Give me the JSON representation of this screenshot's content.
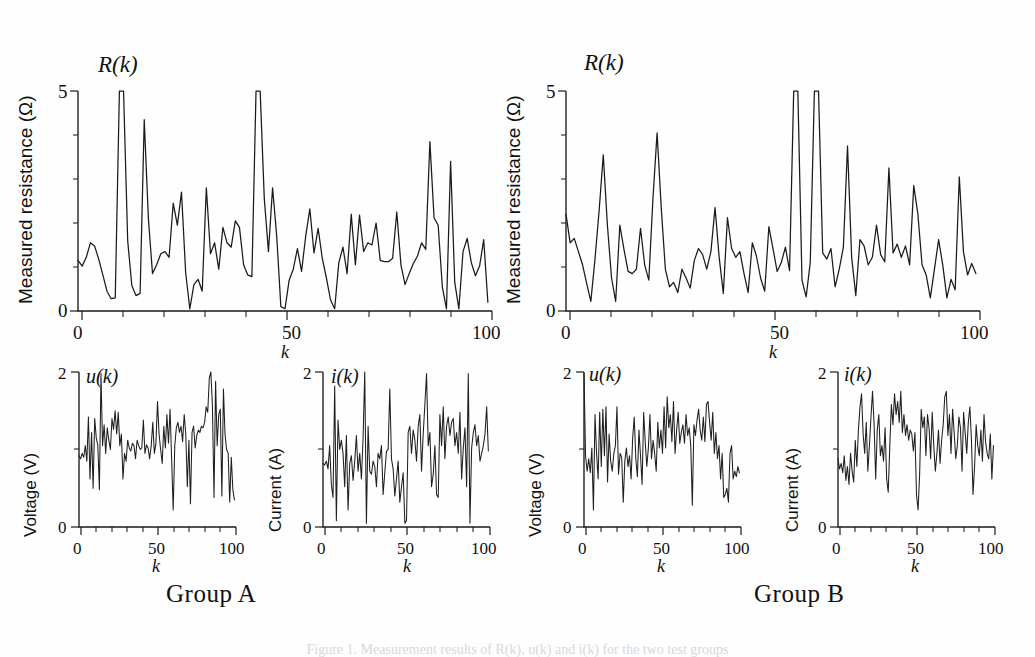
{
  "figure": {
    "caption": "Figure 1. Measurement results of R(k), u(k) and i(k) for the two test groups",
    "groups": [
      {
        "id": "A",
        "label": "Group A"
      },
      {
        "id": "B",
        "label": "Group B"
      }
    ]
  },
  "labels": {
    "resistance_axis_title": "Measured resistance (Ω)",
    "voltage_axis_title": "Voltage (V)",
    "current_axis_title": "Current (A)",
    "resistance_curve": "R(k)",
    "voltage_curve": "u(k)",
    "current_curve": "i(k)",
    "k_axis": "k",
    "tick_0": "0",
    "tick_50": "50",
    "tick_100": "100",
    "tick_2": "2",
    "tick_5": "5"
  },
  "chart_data": [
    {
      "id": "groupA-resistance",
      "type": "line",
      "title": "R(k)",
      "group": "Group A",
      "xlabel": "k",
      "ylabel": "Measured resistance (Ω)",
      "xlim": [
        0,
        100
      ],
      "ylim": [
        0,
        5
      ],
      "xticks": [
        0,
        50,
        100
      ],
      "yticks": [
        0,
        5
      ],
      "minor_xtick_step": 10,
      "minor_ytick_step": 1,
      "grid": false,
      "legend": "none",
      "clipped_above_ylim": true,
      "x": [
        0,
        1,
        2,
        3,
        4,
        5,
        6,
        7,
        8,
        9,
        10,
        11,
        12,
        13,
        14,
        15,
        16,
        17,
        18,
        19,
        20,
        21,
        22,
        23,
        24,
        25,
        26,
        27,
        28,
        29,
        30,
        31,
        32,
        33,
        34,
        35,
        36,
        37,
        38,
        39,
        40,
        41,
        42,
        43,
        44,
        45,
        46,
        47,
        48,
        49,
        50,
        51,
        52,
        53,
        54,
        55,
        56,
        57,
        58,
        59,
        60,
        61,
        62,
        63,
        64,
        65,
        66,
        67,
        68,
        69,
        70,
        71,
        72,
        73,
        74,
        75,
        76,
        77,
        78,
        79,
        80,
        81,
        82,
        83,
        84,
        85,
        86,
        87,
        88,
        89,
        90,
        91,
        92,
        93,
        94,
        95,
        96,
        97,
        98,
        99
      ],
      "values": [
        1.15,
        1.02,
        1.22,
        1.55,
        1.48,
        1.18,
        0.82,
        0.45,
        0.28,
        0.3,
        5.0,
        5.0,
        1.6,
        0.58,
        0.35,
        0.4,
        4.35,
        2.1,
        0.85,
        1.05,
        1.3,
        1.35,
        1.22,
        2.45,
        1.95,
        2.7,
        0.88,
        0.05,
        0.6,
        0.72,
        0.45,
        2.8,
        1.3,
        1.55,
        0.95,
        1.9,
        1.55,
        1.45,
        2.05,
        1.9,
        1.05,
        0.82,
        0.78,
        5.0,
        5.0,
        2.55,
        1.35,
        2.8,
        1.7,
        0.1,
        0.05,
        0.7,
        0.95,
        1.42,
        0.9,
        1.7,
        2.32,
        1.32,
        1.88,
        1.2,
        0.75,
        0.25,
        0.05,
        1.1,
        1.45,
        0.85,
        2.2,
        1.05,
        2.18,
        1.35,
        1.55,
        1.5,
        2.0,
        1.15,
        1.12,
        1.12,
        1.2,
        2.25,
        1.05,
        0.6,
        0.85,
        1.08,
        1.25,
        1.55,
        1.4,
        3.85,
        2.12,
        1.95,
        0.55,
        0.05,
        3.4,
        0.65,
        0.05,
        1.35,
        1.65,
        1.1,
        0.8,
        1.02,
        1.62,
        0.2
      ]
    },
    {
      "id": "groupA-voltage",
      "type": "line",
      "title": "u(k)",
      "group": "Group A",
      "xlabel": "k",
      "ylabel": "Voltage (V)",
      "xlim": [
        0,
        100
      ],
      "ylim": [
        0,
        2
      ],
      "xticks": [
        0,
        50,
        100
      ],
      "yticks": [
        0,
        2
      ],
      "minor_xtick_step": 10,
      "grid": false,
      "legend": "none",
      "x": [
        0,
        1,
        2,
        3,
        4,
        5,
        6,
        7,
        8,
        9,
        10,
        11,
        12,
        13,
        14,
        15,
        16,
        17,
        18,
        19,
        20,
        21,
        22,
        23,
        24,
        25,
        26,
        27,
        28,
        29,
        30,
        31,
        32,
        33,
        34,
        35,
        36,
        37,
        38,
        39,
        40,
        41,
        42,
        43,
        44,
        45,
        46,
        47,
        48,
        49,
        50,
        51,
        52,
        53,
        54,
        55,
        56,
        57,
        58,
        59,
        60,
        61,
        62,
        63,
        64,
        65,
        66,
        67,
        68,
        69,
        70,
        71,
        72,
        73,
        74,
        75,
        76,
        77,
        78,
        79,
        80,
        81,
        82,
        83,
        84,
        85,
        86,
        87,
        88,
        89,
        90,
        91,
        92,
        93,
        94,
        95,
        96,
        97,
        98,
        99
      ],
      "values": [
        0.92,
        0.88,
        0.95,
        0.9,
        1.05,
        0.85,
        1.42,
        0.62,
        1.22,
        0.5,
        1.4,
        1.15,
        1.05,
        0.48,
        1.98,
        1.05,
        1.32,
        0.95,
        1.28,
        1.12,
        1.0,
        1.4,
        1.26,
        1.5,
        1.2,
        1.48,
        1.05,
        1.2,
        0.62,
        0.95,
        0.85,
        1.12,
        1.02,
        0.98,
        1.08,
        1.05,
        0.88,
        1.12,
        1.05,
        1.0,
        1.02,
        1.38,
        0.95,
        1.06,
        1.02,
        0.88,
        1.05,
        1.35,
        0.95,
        1.08,
        1.62,
        1.2,
        1.0,
        0.82,
        1.3,
        1.02,
        1.45,
        1.08,
        1.52,
        0.88,
        0.22,
        1.05,
        1.28,
        1.35,
        1.22,
        1.3,
        1.1,
        1.45,
        1.2,
        0.52,
        1.12,
        0.3,
        1.22,
        1.3,
        1.02,
        1.18,
        1.25,
        1.22,
        1.3,
        1.28,
        1.35,
        1.55,
        1.48,
        1.92,
        2.0,
        1.55,
        0.38,
        1.88,
        1.05,
        1.45,
        1.52,
        0.4,
        1.78,
        1.2,
        1.0,
        0.95,
        0.32,
        0.9,
        0.48,
        0.35
      ]
    },
    {
      "id": "groupA-current",
      "type": "line",
      "title": "i(k)",
      "group": "Group A",
      "xlabel": "k",
      "ylabel": "Current (A)",
      "xlim": [
        0,
        100
      ],
      "ylim": [
        0,
        2
      ],
      "xticks": [
        0,
        50,
        100
      ],
      "yticks": [
        0,
        2
      ],
      "minor_xtick_step": 10,
      "grid": false,
      "legend": "none",
      "x": [
        0,
        1,
        2,
        3,
        4,
        5,
        6,
        7,
        8,
        9,
        10,
        11,
        12,
        13,
        14,
        15,
        16,
        17,
        18,
        19,
        20,
        21,
        22,
        23,
        24,
        25,
        26,
        27,
        28,
        29,
        30,
        31,
        32,
        33,
        34,
        35,
        36,
        37,
        38,
        39,
        40,
        41,
        42,
        43,
        44,
        45,
        46,
        47,
        48,
        49,
        50,
        51,
        52,
        53,
        54,
        55,
        56,
        57,
        58,
        59,
        60,
        61,
        62,
        63,
        64,
        65,
        66,
        67,
        68,
        69,
        70,
        71,
        72,
        73,
        74,
        75,
        76,
        77,
        78,
        79,
        80,
        81,
        82,
        83,
        84,
        85,
        86,
        87,
        88,
        89,
        90,
        91,
        92,
        93,
        94,
        95,
        96,
        97,
        98,
        99
      ],
      "values": [
        0.82,
        0.8,
        0.85,
        0.75,
        1.05,
        0.55,
        0.38,
        1.82,
        0.08,
        1.38,
        1.0,
        1.12,
        0.95,
        0.52,
        1.18,
        0.22,
        0.82,
        0.92,
        0.6,
        0.85,
        1.18,
        0.72,
        0.95,
        0.62,
        1.15,
        2.0,
        0.05,
        1.3,
        0.72,
        0.68,
        0.85,
        0.78,
        0.52,
        0.95,
        0.88,
        1.05,
        0.42,
        0.7,
        0.98,
        1.0,
        1.78,
        0.88,
        0.75,
        0.4,
        0.62,
        0.85,
        0.32,
        0.52,
        0.7,
        0.05,
        0.08,
        1.22,
        1.3,
        0.95,
        1.25,
        1.12,
        0.85,
        1.3,
        1.45,
        0.72,
        1.2,
        1.58,
        1.98,
        1.05,
        1.22,
        0.52,
        0.68,
        1.05,
        0.42,
        0.38,
        1.45,
        1.05,
        1.55,
        0.88,
        1.3,
        1.42,
        1.18,
        1.35,
        1.4,
        1.05,
        1.22,
        0.95,
        1.48,
        0.62,
        1.02,
        1.28,
        0.52,
        1.98,
        0.05,
        1.02,
        1.22,
        1.32,
        1.05,
        1.18,
        0.85,
        0.95,
        1.05,
        1.2,
        1.55,
        0.98
      ]
    },
    {
      "id": "groupB-resistance",
      "type": "line",
      "title": "R(k)",
      "group": "Group B",
      "xlabel": "k",
      "ylabel": "Measured resistance (Ω)",
      "xlim": [
        0,
        100
      ],
      "ylim": [
        0,
        5
      ],
      "xticks": [
        0,
        50,
        100
      ],
      "yticks": [
        0,
        5
      ],
      "minor_xtick_step": 10,
      "minor_ytick_step": 1,
      "grid": false,
      "legend": "none",
      "clipped_above_ylim": true,
      "x": [
        0,
        1,
        2,
        3,
        4,
        5,
        6,
        7,
        8,
        9,
        10,
        11,
        12,
        13,
        14,
        15,
        16,
        17,
        18,
        19,
        20,
        21,
        22,
        23,
        24,
        25,
        26,
        27,
        28,
        29,
        30,
        31,
        32,
        33,
        34,
        35,
        36,
        37,
        38,
        39,
        40,
        41,
        42,
        43,
        44,
        45,
        46,
        47,
        48,
        49,
        50,
        51,
        52,
        53,
        54,
        55,
        56,
        57,
        58,
        59,
        60,
        61,
        62,
        63,
        64,
        65,
        66,
        67,
        68,
        69,
        70,
        71,
        72,
        73,
        74,
        75,
        76,
        77,
        78,
        79,
        80,
        81,
        82,
        83,
        84,
        85,
        86,
        87,
        88,
        89,
        90,
        91,
        92,
        93,
        94,
        95,
        96,
        97,
        98,
        99
      ],
      "values": [
        2.2,
        1.55,
        1.65,
        1.35,
        1.05,
        0.62,
        0.22,
        1.18,
        2.28,
        3.55,
        1.95,
        0.75,
        0.22,
        1.95,
        1.4,
        0.9,
        0.85,
        0.95,
        1.88,
        1.05,
        0.7,
        2.55,
        4.05,
        2.35,
        0.95,
        0.55,
        0.65,
        0.42,
        0.95,
        0.75,
        0.52,
        1.15,
        1.42,
        1.28,
        0.95,
        1.35,
        2.35,
        1.22,
        0.4,
        2.12,
        1.42,
        1.22,
        1.35,
        0.85,
        0.42,
        1.55,
        1.25,
        0.75,
        0.45,
        1.92,
        1.42,
        0.9,
        1.1,
        1.45,
        0.92,
        5.0,
        5.0,
        0.7,
        0.32,
        1.1,
        5.0,
        5.0,
        1.32,
        1.18,
        1.42,
        0.55,
        0.95,
        1.45,
        3.75,
        1.22,
        0.35,
        1.62,
        1.48,
        1.05,
        1.22,
        1.95,
        1.28,
        1.12,
        3.25,
        1.32,
        1.52,
        1.22,
        1.48,
        1.05,
        2.85,
        2.2,
        1.05,
        0.82,
        0.3,
        0.95,
        1.62,
        1.05,
        0.3,
        0.72,
        0.48,
        3.05,
        1.35,
        0.82,
        1.08,
        0.85
      ]
    },
    {
      "id": "groupB-voltage",
      "type": "line",
      "title": "u(k)",
      "group": "Group B",
      "xlabel": "k",
      "ylabel": "Voltage (V)",
      "xlim": [
        0,
        100
      ],
      "ylim": [
        0,
        2
      ],
      "xticks": [
        0,
        50,
        100
      ],
      "yticks": [
        0,
        2
      ],
      "minor_xtick_step": 10,
      "grid": false,
      "legend": "none",
      "x": [
        0,
        1,
        2,
        3,
        4,
        5,
        6,
        7,
        8,
        9,
        10,
        11,
        12,
        13,
        14,
        15,
        16,
        17,
        18,
        19,
        20,
        21,
        22,
        23,
        24,
        25,
        26,
        27,
        28,
        29,
        30,
        31,
        32,
        33,
        34,
        35,
        36,
        37,
        38,
        39,
        40,
        41,
        42,
        43,
        44,
        45,
        46,
        47,
        48,
        49,
        50,
        51,
        52,
        53,
        54,
        55,
        56,
        57,
        58,
        59,
        60,
        61,
        62,
        63,
        64,
        65,
        66,
        67,
        68,
        69,
        70,
        71,
        72,
        73,
        74,
        75,
        76,
        77,
        78,
        79,
        80,
        81,
        82,
        83,
        84,
        85,
        86,
        87,
        88,
        89,
        90,
        91,
        92,
        93,
        94,
        95,
        96,
        97,
        98,
        99
      ],
      "values": [
        1.98,
        0.92,
        0.72,
        0.88,
        0.7,
        1.02,
        0.22,
        1.45,
        0.95,
        0.62,
        1.48,
        0.78,
        1.52,
        0.92,
        1.55,
        0.58,
        1.2,
        0.85,
        0.72,
        0.95,
        1.05,
        1.55,
        0.68,
        0.95,
        0.9,
        0.32,
        0.85,
        1.02,
        0.78,
        0.92,
        0.62,
        1.15,
        1.42,
        0.88,
        0.65,
        1.25,
        0.92,
        0.55,
        1.48,
        1.1,
        0.78,
        1.02,
        1.45,
        0.88,
        1.12,
        0.95,
        0.72,
        1.35,
        1.02,
        1.25,
        0.95,
        1.55,
        1.02,
        1.68,
        1.28,
        1.45,
        1.1,
        1.62,
        0.95,
        1.25,
        1.48,
        1.08,
        1.22,
        1.32,
        1.08,
        1.45,
        1.18,
        1.28,
        1.05,
        0.28,
        1.32,
        1.18,
        1.38,
        1.52,
        1.25,
        1.12,
        1.42,
        1.1,
        1.58,
        1.62,
        1.35,
        1.12,
        1.48,
        0.95,
        1.22,
        0.88,
        1.05,
        0.62,
        0.95,
        0.38,
        0.42,
        0.5,
        0.32,
        0.95,
        1.05,
        0.62,
        0.72,
        0.65,
        0.78,
        0.7
      ]
    },
    {
      "id": "groupB-current",
      "type": "line",
      "title": "i(k)",
      "group": "Group B",
      "xlabel": "k",
      "ylabel": "Current (A)",
      "xlim": [
        0,
        100
      ],
      "ylim": [
        0,
        2
      ],
      "xticks": [
        0,
        50,
        100
      ],
      "yticks": [
        0,
        2
      ],
      "minor_xtick_step": 10,
      "grid": false,
      "legend": "none",
      "x": [
        0,
        1,
        2,
        3,
        4,
        5,
        6,
        7,
        8,
        9,
        10,
        11,
        12,
        13,
        14,
        15,
        16,
        17,
        18,
        19,
        20,
        21,
        22,
        23,
        24,
        25,
        26,
        27,
        28,
        29,
        30,
        31,
        32,
        33,
        34,
        35,
        36,
        37,
        38,
        39,
        40,
        41,
        42,
        43,
        44,
        45,
        46,
        47,
        48,
        49,
        50,
        51,
        52,
        53,
        54,
        55,
        56,
        57,
        58,
        59,
        60,
        61,
        62,
        63,
        64,
        65,
        66,
        67,
        68,
        69,
        70,
        71,
        72,
        73,
        74,
        75,
        76,
        77,
        78,
        79,
        80,
        81,
        82,
        83,
        84,
        85,
        86,
        87,
        88,
        89,
        90,
        91,
        92,
        93,
        94,
        95,
        96,
        97,
        98,
        99
      ],
      "values": [
        0.88,
        0.75,
        0.82,
        0.7,
        0.92,
        0.6,
        0.78,
        0.55,
        0.95,
        0.72,
        0.58,
        1.12,
        0.78,
        1.25,
        1.55,
        1.72,
        1.2,
        0.95,
        1.35,
        0.72,
        1.05,
        1.42,
        1.75,
        1.32,
        0.62,
        1.25,
        1.45,
        0.92,
        1.05,
        0.85,
        1.28,
        0.62,
        0.45,
        1.05,
        1.58,
        1.32,
        1.72,
        1.45,
        1.62,
        1.35,
        1.75,
        1.22,
        1.45,
        1.18,
        1.32,
        1.12,
        1.25,
        1.2,
        0.98,
        1.22,
        0.42,
        0.22,
        0.68,
        1.52,
        1.28,
        1.42,
        0.92,
        1.45,
        1.28,
        0.88,
        1.48,
        1.05,
        0.72,
        0.95,
        1.25,
        0.82,
        1.12,
        1.32,
        1.68,
        1.75,
        1.18,
        1.45,
        0.95,
        1.52,
        1.22,
        0.88,
        1.05,
        1.42,
        1.28,
        0.72,
        1.48,
        1.22,
        0.95,
        1.35,
        1.55,
        1.12,
        0.42,
        0.78,
        1.32,
        1.05,
        0.92,
        1.25,
        0.85,
        1.45,
        1.1,
        0.95,
        0.88,
        1.2,
        0.62,
        1.05
      ]
    }
  ]
}
